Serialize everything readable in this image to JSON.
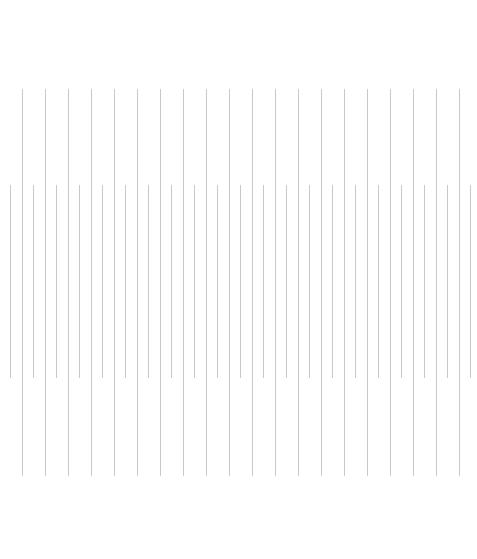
{
  "canvas": {
    "width": 477,
    "height": 559,
    "background": "#ffffff"
  },
  "pattern": {
    "line_color": "#c8c8c8",
    "line_width": 1,
    "rows": [
      {
        "name": "long-lines",
        "top": 89,
        "bottom": 476,
        "x_start": 22,
        "spacing": 23,
        "count": 20
      },
      {
        "name": "short-lines",
        "top": 185,
        "bottom": 378,
        "x_start": 10,
        "spacing": 23,
        "count": 21
      }
    ]
  }
}
